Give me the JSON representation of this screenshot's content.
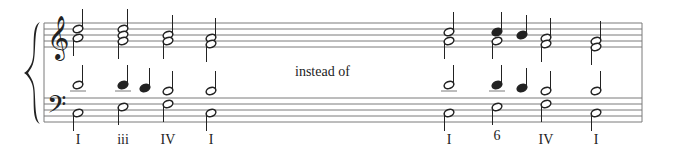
{
  "annotation": "instead of",
  "colors": {
    "ink": "#222222",
    "staff": "#7a7a7a",
    "background": "#ffffff"
  },
  "staff": {
    "left": 44,
    "right": 642,
    "treble_lines": [
      23,
      29,
      35,
      41,
      47
    ],
    "bass_lines": [
      98,
      104,
      110,
      116,
      122
    ]
  },
  "clefs": {
    "treble": "treble-clef",
    "bass": "bass-clef"
  },
  "chords": [
    {
      "x": 78,
      "label": "I",
      "numeral_y": 140,
      "treble": [
        {
          "y": 29,
          "filled": false
        },
        {
          "y": 38,
          "filled": false
        }
      ],
      "treble_stem": "split",
      "tenor": [
        {
          "y": 85,
          "filled": false,
          "ledger": true
        }
      ],
      "bass": [
        {
          "y": 113,
          "filled": false
        }
      ]
    },
    {
      "x": 123,
      "label": "iii",
      "numeral_y": 140,
      "treble": [
        {
          "y": 29,
          "filled": false
        },
        {
          "y": 35,
          "filled": false
        },
        {
          "y": 41,
          "filled": false
        }
      ],
      "treble_stem": "split",
      "tenor": [
        {
          "y": 85,
          "filled": true,
          "ledger": true
        }
      ],
      "bass": [
        {
          "y": 107,
          "filled": false
        }
      ]
    },
    {
      "x": 145,
      "label": "",
      "passing": true,
      "tenor": [
        {
          "y": 88,
          "filled": true,
          "ledger": false
        }
      ]
    },
    {
      "x": 168,
      "label": "IV",
      "numeral_y": 140,
      "treble": [
        {
          "y": 35,
          "filled": false
        },
        {
          "y": 41,
          "filled": false
        }
      ],
      "treble_stem": "split",
      "tenor": [
        {
          "y": 91,
          "filled": false,
          "ledger": false
        }
      ],
      "bass": [
        {
          "y": 104,
          "filled": false
        }
      ]
    },
    {
      "x": 211,
      "label": "I",
      "numeral_y": 140,
      "treble": [
        {
          "y": 38,
          "filled": false
        },
        {
          "y": 44,
          "filled": false
        }
      ],
      "treble_stem": "split",
      "tenor": [
        {
          "y": 91,
          "filled": false,
          "ledger": false
        }
      ],
      "bass": [
        {
          "y": 113,
          "filled": false
        }
      ]
    },
    {
      "x": 449,
      "label": "I",
      "numeral_y": 140,
      "treble": [
        {
          "y": 32,
          "filled": false
        },
        {
          "y": 41,
          "filled": false
        }
      ],
      "treble_stem": "split",
      "tenor": [
        {
          "y": 85,
          "filled": false,
          "ledger": true
        }
      ],
      "bass": [
        {
          "y": 113,
          "filled": false
        }
      ]
    },
    {
      "x": 497,
      "label": "6",
      "numeral_y": 136,
      "treble": [
        {
          "y": 32,
          "filled": true
        },
        {
          "y": 41,
          "filled": false
        }
      ],
      "treble_stem": "split",
      "tenor": [
        {
          "y": 85,
          "filled": true,
          "ledger": true
        }
      ],
      "bass": [
        {
          "y": 107,
          "filled": false
        }
      ]
    },
    {
      "x": 522,
      "label": "",
      "passing": true,
      "treble": [
        {
          "y": 35,
          "filled": true
        }
      ],
      "treble_stem": "up",
      "tenor": [
        {
          "y": 88,
          "filled": true,
          "ledger": false
        }
      ]
    },
    {
      "x": 546,
      "label": "IV",
      "numeral_y": 140,
      "treble": [
        {
          "y": 38,
          "filled": false
        },
        {
          "y": 44,
          "filled": false
        }
      ],
      "treble_stem": "split",
      "tenor": [
        {
          "y": 91,
          "filled": false,
          "ledger": false
        }
      ],
      "bass": [
        {
          "y": 104,
          "filled": false
        }
      ]
    },
    {
      "x": 596,
      "label": "I",
      "numeral_y": 140,
      "treble": [
        {
          "y": 41,
          "filled": false
        },
        {
          "y": 47,
          "filled": false
        }
      ],
      "treble_stem": "split",
      "tenor": [
        {
          "y": 91,
          "filled": false,
          "ledger": false
        }
      ],
      "bass": [
        {
          "y": 113,
          "filled": false
        }
      ]
    }
  ],
  "labels": [
    {
      "text": "I",
      "x": 78,
      "y": 132
    },
    {
      "text": "iii",
      "x": 123,
      "y": 132
    },
    {
      "text": "IV",
      "x": 168,
      "y": 132
    },
    {
      "text": "I",
      "x": 211,
      "y": 132
    },
    {
      "text": "I",
      "x": 449,
      "y": 132
    },
    {
      "text": "6",
      "x": 497,
      "y": 128
    },
    {
      "text": "IV",
      "x": 546,
      "y": 132
    },
    {
      "text": "I",
      "x": 596,
      "y": 132
    }
  ]
}
